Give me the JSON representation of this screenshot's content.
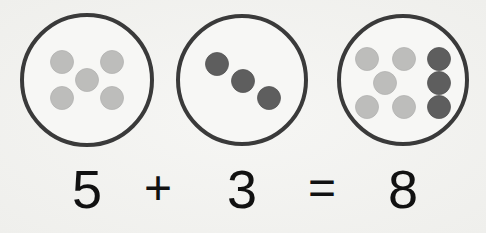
{
  "colors": {
    "background": "#f2f2f0",
    "circle_stroke": "#3a3a3a",
    "light_counter": "#bdbdbb",
    "dark_counter": "#5e5e5e",
    "text": "#111111"
  },
  "groups": [
    {
      "label": "first-addend-set",
      "count": 5,
      "counters": [
        {
          "x": 62,
          "y": 62,
          "shade": "light"
        },
        {
          "x": 112,
          "y": 62,
          "shade": "light"
        },
        {
          "x": 87,
          "y": 80,
          "shade": "light"
        },
        {
          "x": 62,
          "y": 98,
          "shade": "light"
        },
        {
          "x": 112,
          "y": 98,
          "shade": "light"
        }
      ],
      "circle": {
        "cx": 87,
        "cy": 80,
        "r": 65
      }
    },
    {
      "label": "second-addend-set",
      "count": 3,
      "counters": [
        {
          "x": 217,
          "y": 64,
          "shade": "dark"
        },
        {
          "x": 243,
          "y": 81,
          "shade": "dark"
        },
        {
          "x": 269,
          "y": 98,
          "shade": "dark"
        }
      ],
      "circle": {
        "cx": 242,
        "cy": 80,
        "r": 64
      }
    },
    {
      "label": "sum-set",
      "count": 8,
      "counters": [
        {
          "x": 367,
          "y": 59,
          "shade": "light"
        },
        {
          "x": 404,
          "y": 59,
          "shade": "light"
        },
        {
          "x": 439,
          "y": 59,
          "shade": "dark"
        },
        {
          "x": 385,
          "y": 83,
          "shade": "light"
        },
        {
          "x": 439,
          "y": 83,
          "shade": "dark"
        },
        {
          "x": 367,
          "y": 107,
          "shade": "light"
        },
        {
          "x": 404,
          "y": 107,
          "shade": "light"
        },
        {
          "x": 439,
          "y": 107,
          "shade": "dark"
        }
      ],
      "circle": {
        "cx": 403,
        "cy": 80,
        "r": 64
      }
    }
  ],
  "equation": {
    "addend1": "5",
    "plus": "+",
    "addend2": "3",
    "equals": "=",
    "sum": "8",
    "full": "5 + 3 = 8"
  }
}
